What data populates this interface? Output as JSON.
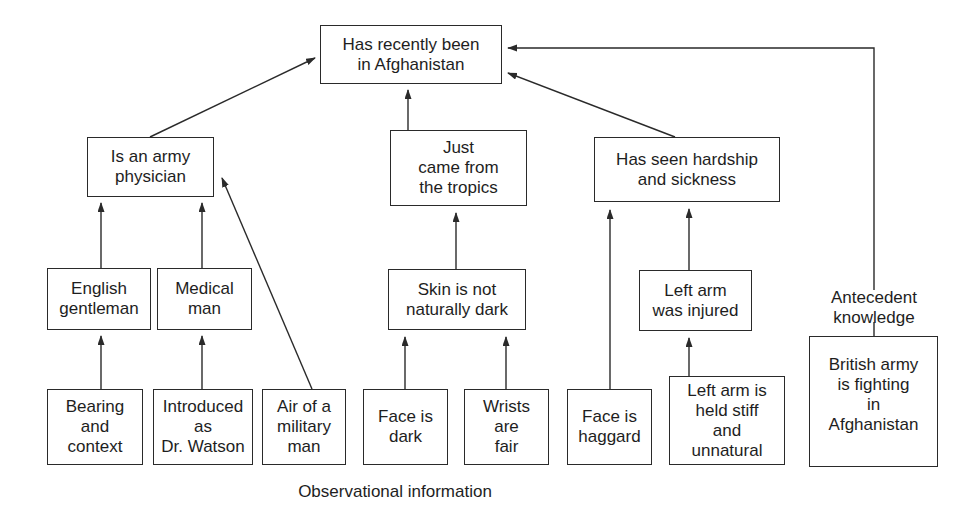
{
  "diagram": {
    "type": "inference-tree",
    "conclusion": {
      "id": "afghanistan",
      "text": "Has recently been\nin Afghanistan"
    },
    "intermediate": [
      {
        "id": "army_physician",
        "text": "Is an army\nphysician"
      },
      {
        "id": "tropics",
        "text": "Just\ncame from\nthe tropics"
      },
      {
        "id": "hardship",
        "text": "Has seen hardship\nand sickness"
      }
    ],
    "second_level": [
      {
        "id": "english_gentleman",
        "text": "English\ngentleman"
      },
      {
        "id": "medical_man",
        "text": "Medical\nman"
      },
      {
        "id": "skin_not_dark",
        "text": "Skin is not\nnaturally dark"
      },
      {
        "id": "left_arm_injured",
        "text": "Left arm\nwas injured"
      }
    ],
    "observations": [
      {
        "id": "bearing",
        "text": "Bearing\nand\ncontext"
      },
      {
        "id": "introduced",
        "text": "Introduced\nas\nDr. Watson"
      },
      {
        "id": "air_military",
        "text": "Air of a\nmilitary\nman"
      },
      {
        "id": "face_dark",
        "text": "Face is\ndark"
      },
      {
        "id": "wrists_fair",
        "text": "Wrists\nare\nfair"
      },
      {
        "id": "face_haggard",
        "text": "Face is\nhaggard"
      },
      {
        "id": "arm_stiff",
        "text": "Left arm is\nheld stiff\nand\nunnatural"
      }
    ],
    "antecedent": {
      "id": "british_army",
      "text": "British army\nis fighting\nin\nAfghanistan"
    },
    "labels": {
      "antecedent": "Antecedent\nknowledge",
      "observational": "Observational information"
    },
    "edges": [
      [
        "bearing",
        "english_gentleman"
      ],
      [
        "introduced",
        "medical_man"
      ],
      [
        "air_military",
        "army_physician"
      ],
      [
        "english_gentleman",
        "army_physician"
      ],
      [
        "medical_man",
        "army_physician"
      ],
      [
        "face_dark",
        "skin_not_dark"
      ],
      [
        "wrists_fair",
        "skin_not_dark"
      ],
      [
        "skin_not_dark",
        "tropics"
      ],
      [
        "face_haggard",
        "hardship"
      ],
      [
        "arm_stiff",
        "left_arm_injured"
      ],
      [
        "left_arm_injured",
        "hardship"
      ],
      [
        "army_physician",
        "afghanistan"
      ],
      [
        "tropics",
        "afghanistan"
      ],
      [
        "hardship",
        "afghanistan"
      ],
      [
        "british_army",
        "afghanistan"
      ]
    ],
    "colors": {
      "line": "#2a2a2a",
      "text": "#1e1e1e",
      "background": "#ffffff"
    }
  }
}
